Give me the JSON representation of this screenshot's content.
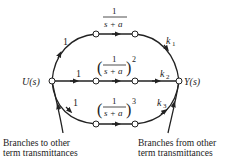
{
  "nodes": {
    "input": "U(s)",
    "output": "Y(s)"
  },
  "branches": {
    "top": {
      "in_gain": "1",
      "tf_num": "1",
      "tf_den": "s + a",
      "exponent": "",
      "out_gain": "k",
      "out_sub": "1"
    },
    "middle": {
      "in_gain": "1",
      "tf_num": "1",
      "tf_den": "s + a",
      "exponent": "2",
      "out_gain": "k",
      "out_sub": "2"
    },
    "bottom": {
      "in_gain": "1",
      "tf_num": "1",
      "tf_den": "s + a",
      "exponent": "3",
      "out_gain": "k",
      "out_sub": "3"
    }
  },
  "captions": {
    "left_line1": "Branches to other",
    "left_line2": "term transmittances",
    "right_line1": "Branches from other",
    "right_line2": "term transmittances"
  },
  "colors": {
    "ink": "#222222",
    "background": "#ffffff"
  }
}
